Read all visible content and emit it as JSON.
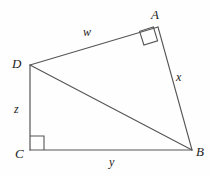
{
  "figure": {
    "kind": "geometry-diagram",
    "background_color": "#fefefe",
    "stroke_color": "#555555",
    "text_color": "#1b1b1b",
    "stroke_width": 1,
    "vertices": [
      {
        "id": "A",
        "label": "A",
        "x": 158,
        "y": 27
      },
      {
        "id": "B",
        "label": "B",
        "x": 192,
        "y": 150
      },
      {
        "id": "C",
        "label": "C",
        "x": 30,
        "y": 150
      },
      {
        "id": "D",
        "label": "D",
        "x": 30,
        "y": 65
      }
    ],
    "edges": [
      {
        "id": "DA",
        "from": "D",
        "to": "A",
        "label": "w"
      },
      {
        "id": "AB",
        "from": "A",
        "to": "B",
        "label": "x"
      },
      {
        "id": "CB",
        "from": "C",
        "to": "B",
        "label": "y"
      },
      {
        "id": "DC",
        "from": "D",
        "to": "C",
        "label": "z"
      },
      {
        "id": "DB",
        "from": "D",
        "to": "B",
        "label": ""
      }
    ],
    "side_labels": [
      {
        "id": "w",
        "text": "w",
        "edge": "DA"
      },
      {
        "id": "x",
        "text": "x",
        "edge": "AB"
      },
      {
        "id": "y",
        "text": "y",
        "edge": "CB"
      },
      {
        "id": "z",
        "text": "z",
        "edge": "DC"
      }
    ],
    "right_angles": [
      {
        "id": "angle-A",
        "at": "A",
        "between": [
          "DA",
          "AB"
        ]
      },
      {
        "id": "angle-C",
        "at": "C",
        "between": [
          "DC",
          "CB"
        ]
      }
    ]
  }
}
